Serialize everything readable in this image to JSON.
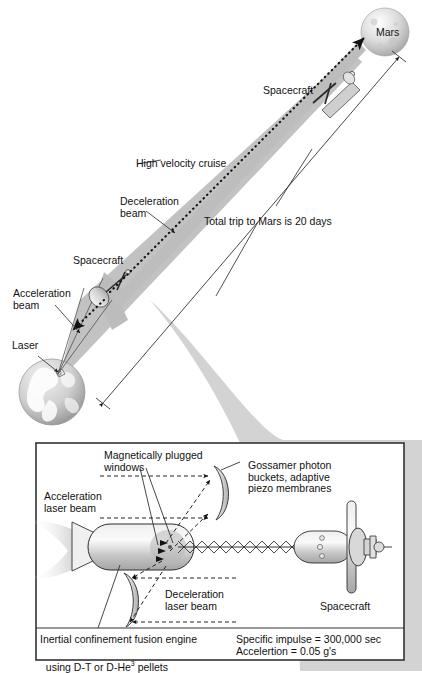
{
  "figure": {
    "title_absent": true,
    "colors": {
      "beam_gray": "#bdbdbd",
      "shadow_gray": "#c9c9c9",
      "body_gray": "#d2d2d2",
      "outline": "#1a1a1a",
      "panel_border": "#333333"
    }
  },
  "top_diagram": {
    "labels": {
      "mars": "Mars",
      "spacecraft_far": "Spacecraft",
      "spacecraft_near": "Spacecraft",
      "high_velocity_cruise": "High velocity cruise",
      "deceleration_beam": "Deceleration\nbeam",
      "acceleration_beam": "Acceleration\nbeam",
      "laser": "Laser",
      "total_trip": "Total trip to Mars is 20 days"
    }
  },
  "bottom_panel": {
    "labels": {
      "magnetically_plugged_windows": "Magnetically plugged\nwindows",
      "gossamer": "Gossamer photon\nbuckets, adaptive\npiezo membranes",
      "acceleration_laser_beam": "Acceleration\nlaser beam",
      "deceleration_laser_beam": "Deceleration\nlaser beam",
      "spacecraft": "Spacecraft",
      "engine_line1": "Inertial confinement fusion engine",
      "engine_line2_pre": "using D-T or D-He",
      "engine_line2_sup": "3",
      "engine_line2_post": " pellets"
    },
    "specs": {
      "specific_impulse": "Specific impulse = 300,000 sec",
      "acceleration": "Accelertion = 0.05 g's"
    }
  }
}
